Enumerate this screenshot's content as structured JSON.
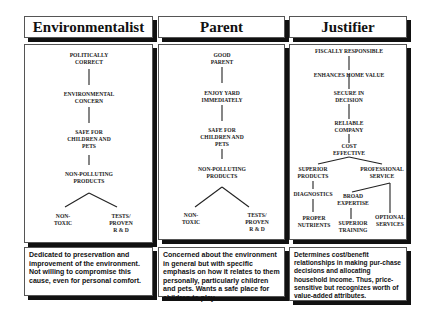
{
  "columns": [
    {
      "title": "Environmentalist",
      "nodes": [
        "POLITICALLY\nCORRECT",
        "ENVIRONMENTAL\nCONCERN",
        "SAFE FOR\nCHILDREN AND\nPETS",
        "NON-POLLUTING\nPRODUCTS",
        "NON-\nTOXIC",
        "TESTS/\nPROVEN\nR & D"
      ],
      "description": "Dedicated to preservation and improvement of the environment. Not willing to compromise this cause, even for personal comfort."
    },
    {
      "title": "Parent",
      "nodes": [
        "GOOD\nPARENT",
        "ENJOY YARD\nIMMEDIATELY",
        "SAFE FOR\nCHILDREN AND\nPETS",
        "NON-POLLUTING\nPRODUCTS",
        "NON-\nTOXIC",
        "TESTS/\nPROVEN\nR & D"
      ],
      "description": "Concerned about the environment in general but with specific emphasis on how it relates to them personally, particularly children and pets. Wants a safe place for children to play."
    },
    {
      "title": "Justifier",
      "nodes": [
        "FISCALLY RESPONSIBLE",
        "ENHANCES HOME VALUE",
        "SECURE IN\nDECISION",
        "RELIABLE\nCOMPANY",
        "COST\nEFFECTIVE",
        "SUPERIOR\nPRODUCTS",
        "PROFESSIONAL\nSERVICE",
        "DIAGNOSTICS",
        "BROAD\nEXPERTISE",
        "PROPER\nNUTRIENTS",
        "SUPERIOR\nTRAINING",
        "OPTIONAL\nSERVICES"
      ],
      "description": "Determines cost/benefit relationships in making pur-chase decisions and allocating household income. Thus, price-sensitive but recognizes worth of value-added attributes."
    }
  ]
}
